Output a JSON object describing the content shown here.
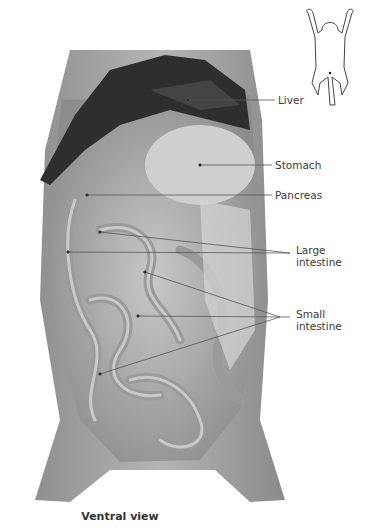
{
  "figure": {
    "caption": "Ventral view",
    "orientation_icon": "rat-outline-icon",
    "labels": [
      {
        "id": "liver",
        "text": "Liver"
      },
      {
        "id": "stomach",
        "text": "Stomach"
      },
      {
        "id": "pancreas",
        "text": "Pancreas"
      },
      {
        "id": "large-intestine",
        "line1": "Large",
        "line2": "intestine"
      },
      {
        "id": "small-intestine",
        "line1": "Small",
        "line2": "intestine"
      }
    ]
  },
  "colors": {
    "background": "#ffffff",
    "leader_line": "#555555",
    "label_text": "#3a3a3a",
    "liver": "#2b2b2b",
    "tissue": "#a8a8a8"
  }
}
